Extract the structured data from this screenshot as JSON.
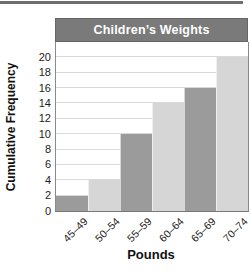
{
  "page": {
    "top_rule_color": "#6e6e6e"
  },
  "chart_data": {
    "type": "bar",
    "title": "Children’s Weights",
    "xlabel": "Pounds",
    "ylabel": "Cumulative Frequency",
    "categories": [
      "45–49",
      "50–54",
      "55–59",
      "60–64",
      "65–69",
      "70–74"
    ],
    "values": [
      2,
      4,
      10,
      14,
      16,
      20
    ],
    "bar_colors": [
      "#9b9b9b",
      "#d6d6d6",
      "#9b9b9b",
      "#d6d6d6",
      "#9b9b9b",
      "#d6d6d6"
    ],
    "yticks": [
      0,
      2,
      4,
      6,
      8,
      10,
      12,
      14,
      16,
      18,
      20
    ],
    "ylim": [
      0,
      22
    ],
    "grid": true,
    "legend_position": "none",
    "title_bg": "#7a7a7a",
    "title_color": "#ffffff",
    "gridline_color": "#d9d9d9"
  }
}
